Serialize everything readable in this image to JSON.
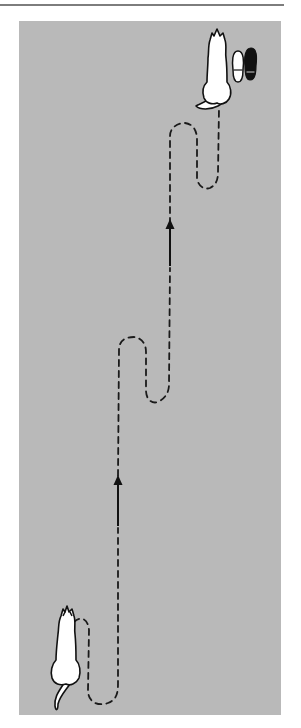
{
  "figure": {
    "type": "illustration",
    "colors": {
      "background": "#ffffff",
      "panel": "#b9b9b9",
      "line": "#1a1a1a",
      "cat_fill": "#ffffff",
      "shoe_dark": "#111111",
      "shoe_light": "#ffffff",
      "rule": "#7d7d7d"
    },
    "elements": {
      "start_cat": {
        "label": "cat-start",
        "position": "bottom-left"
      },
      "end_cat": {
        "label": "cat-end",
        "position": "top-right"
      },
      "shoes": {
        "label": "shoes",
        "position": "top-right",
        "count": 2
      },
      "path": {
        "style": "dashed",
        "loops": 3
      },
      "arrows": [
        {
          "direction": "up",
          "position": "upper"
        },
        {
          "direction": "up",
          "position": "lower"
        }
      ]
    },
    "caption": ""
  }
}
